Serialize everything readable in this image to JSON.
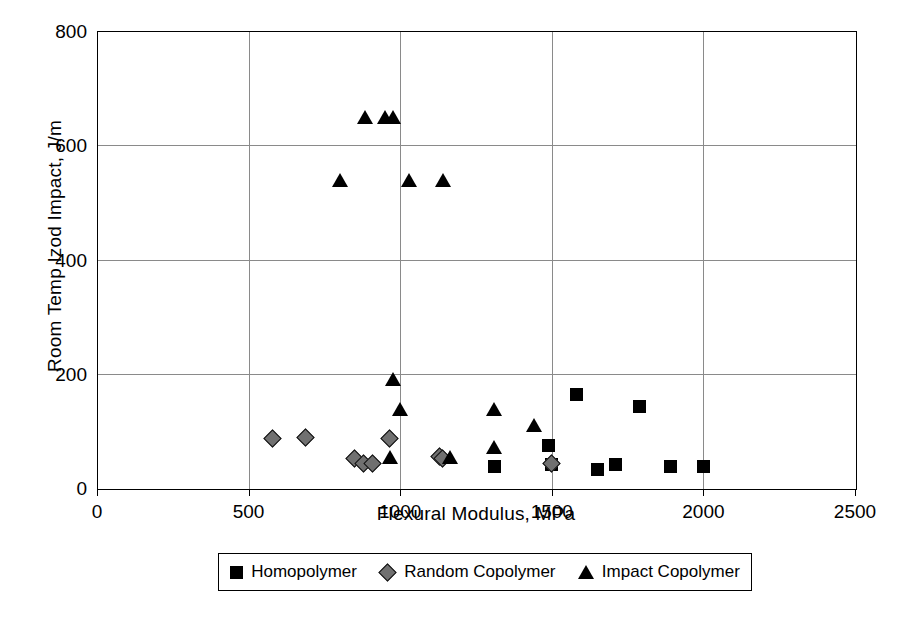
{
  "chart_data": {
    "type": "scatter",
    "title": "",
    "xlabel": "Flexural Modulus, MPa",
    "ylabel": "Room Temp Izod Impact, J/m",
    "xlim": [
      0,
      2500
    ],
    "ylim": [
      0,
      800
    ],
    "xticks": [
      0,
      500,
      1000,
      1500,
      2000,
      2500
    ],
    "yticks": [
      0,
      200,
      400,
      600,
      800
    ],
    "grid": true,
    "legend_position": "bottom",
    "series": [
      {
        "name": "Homopolymer",
        "marker": "square",
        "color": "#000000",
        "points": [
          [
            1310,
            38
          ],
          [
            1490,
            75
          ],
          [
            1500,
            42
          ],
          [
            1580,
            163
          ],
          [
            1650,
            32
          ],
          [
            1710,
            42
          ],
          [
            1790,
            143
          ],
          [
            1890,
            38
          ],
          [
            2000,
            38
          ]
        ]
      },
      {
        "name": "Random Copolymer",
        "marker": "diamond",
        "color": "#707070",
        "points": [
          [
            580,
            85
          ],
          [
            690,
            88
          ],
          [
            850,
            50
          ],
          [
            880,
            42
          ],
          [
            910,
            42
          ],
          [
            965,
            85
          ],
          [
            1130,
            55
          ],
          [
            1140,
            50
          ],
          [
            1500,
            42
          ]
        ]
      },
      {
        "name": "Impact Copolymer",
        "marker": "triangle",
        "color": "#000000",
        "points": [
          [
            885,
            650
          ],
          [
            950,
            650
          ],
          [
            975,
            650
          ],
          [
            800,
            540
          ],
          [
            1030,
            540
          ],
          [
            1140,
            540
          ],
          [
            975,
            190
          ],
          [
            1000,
            138
          ],
          [
            965,
            55
          ],
          [
            1165,
            55
          ],
          [
            1310,
            138
          ],
          [
            1310,
            72
          ],
          [
            1440,
            110
          ]
        ]
      }
    ]
  },
  "axes": {
    "ylabel": "Room Temp Izod Impact, J/m",
    "xlabel": "Flexural Modulus, MPa",
    "ytick_labels": [
      "800",
      "600",
      "400",
      "200",
      "0"
    ],
    "xtick_labels": [
      "0",
      "500",
      "1000",
      "1500",
      "2000",
      "2500"
    ]
  },
  "legend": {
    "items": [
      {
        "label": "Homopolymer",
        "marker": "square"
      },
      {
        "label": "Random Copolymer",
        "marker": "diamond"
      },
      {
        "label": "Impact Copolymer",
        "marker": "triangle"
      }
    ]
  }
}
